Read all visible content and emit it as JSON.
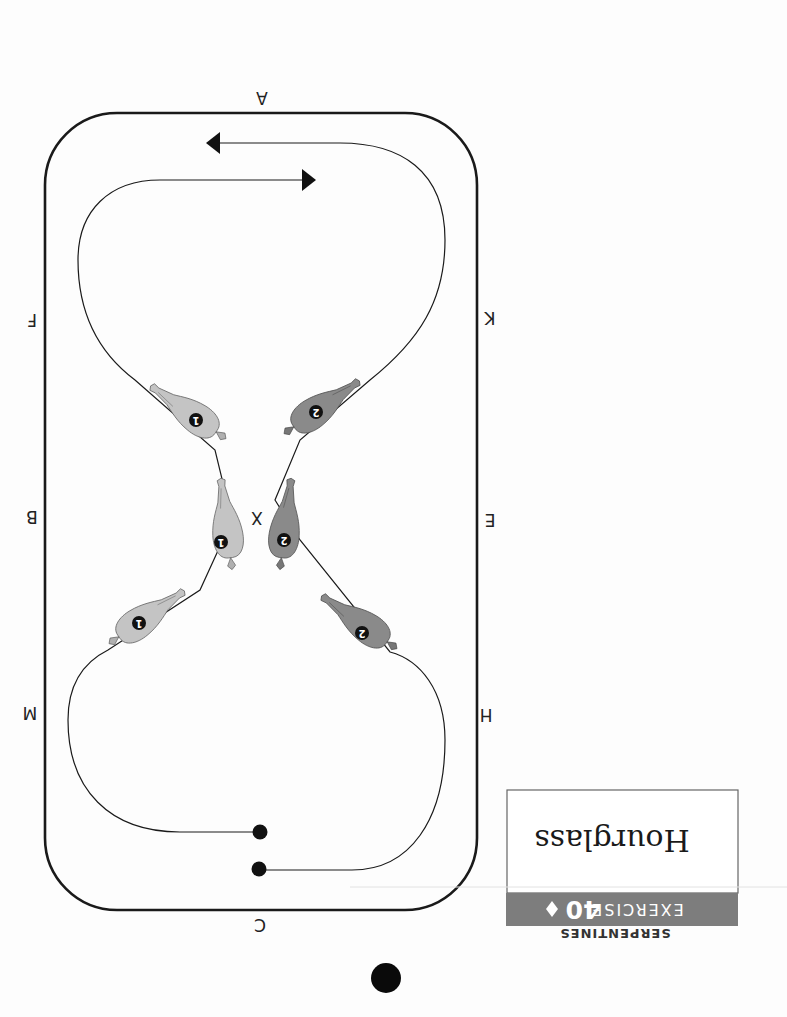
{
  "page": {
    "orientation": "rotated-180",
    "category": "SERPENTINES",
    "exercise_label": "EXERCISE",
    "exercise_number": "40",
    "separator_icon": "diamond-icon",
    "title": "Hourglass"
  },
  "arena": {
    "letters": {
      "top": "A",
      "bottom": "C",
      "left_upper": "F",
      "left_middle": "B",
      "left_lower": "M",
      "right_upper": "K",
      "right_middle": "E",
      "right_lower": "H",
      "center": "X"
    }
  },
  "riders": [
    {
      "id": "1",
      "label": "1",
      "color": "#c4c4c4"
    },
    {
      "id": "2",
      "label": "2",
      "color": "#8a8a8a"
    }
  ],
  "colors": {
    "header_bar": "#7d7d7d",
    "line": "#1a1a1a",
    "rider1_fill": "#c4c4c4",
    "rider2_fill": "#8a8a8a"
  }
}
